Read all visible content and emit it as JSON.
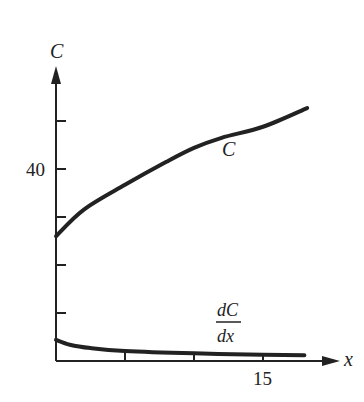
{
  "chart_data": {
    "type": "line",
    "title": "",
    "xlabel": "x",
    "ylabel": "C",
    "x_ticks": [
      5,
      10,
      15
    ],
    "x_tick_labels": [
      "",
      "",
      "15"
    ],
    "y_ticks": [
      10,
      20,
      30,
      40,
      50
    ],
    "y_tick_labels": [
      "",
      "",
      "",
      "40",
      ""
    ],
    "xlim": [
      0,
      20.5
    ],
    "ylim": [
      0,
      62
    ],
    "grid": false,
    "legend": "none (curves labeled inline)",
    "series": [
      {
        "name": "C",
        "label": "C",
        "x": [
          0,
          2,
          5,
          8,
          10,
          12,
          15,
          18.2
        ],
        "y": [
          26,
          31.5,
          36.7,
          41.5,
          44.4,
          46.5,
          48.8,
          52.7
        ]
      },
      {
        "name": "dC/dx",
        "label_num": "dC",
        "label_den": "dx",
        "x": [
          0,
          1,
          2.5,
          5,
          10,
          15,
          18
        ],
        "y": [
          4.4,
          3.4,
          2.7,
          2.1,
          1.6,
          1.3,
          1.2
        ]
      }
    ],
    "annotations": [
      {
        "text": "C",
        "near_x": 10.5,
        "near_y": 38
      },
      {
        "text": "dC/dx",
        "near_x": 12.5,
        "near_y": 7
      }
    ]
  }
}
